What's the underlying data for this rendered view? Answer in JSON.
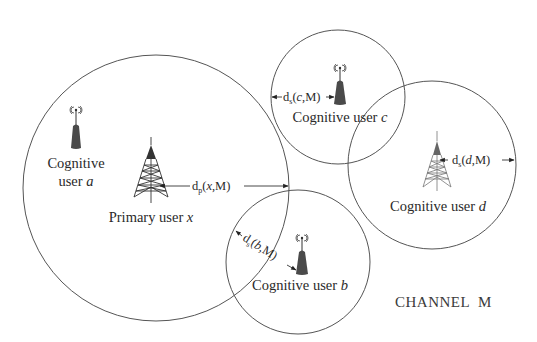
{
  "diagram": {
    "channel_label": "CHANNEL  M",
    "nodes": {
      "primary_x": {
        "label_prefix": "Primary user ",
        "label_var": "x",
        "icon": "transmission-tower-icon",
        "type": "primary"
      },
      "cognitive_a": {
        "label_line1": "Cognitive",
        "label_line2_prefix": "user ",
        "label_var": "a",
        "icon": "wireless-device-icon",
        "type": "cognitive"
      },
      "cognitive_b": {
        "label_prefix": "Cognitive user ",
        "label_var": "b",
        "icon": "wireless-device-icon",
        "type": "cognitive"
      },
      "cognitive_c": {
        "label_prefix": "Cognitive user ",
        "label_var": "c",
        "icon": "wireless-device-icon",
        "type": "cognitive"
      },
      "cognitive_d": {
        "label_prefix": "Cognitive user ",
        "label_var": "d",
        "icon": "transmission-tower-icon",
        "type": "cognitive"
      }
    },
    "distances": {
      "dp_x": {
        "base": "d",
        "sub": "p",
        "open": "(",
        "var": "x",
        "rest": ",M)"
      },
      "ds_b": {
        "base": "d",
        "sub": "s",
        "open": "(",
        "var": "b",
        "rest": ",M)"
      },
      "ds_c": {
        "base": "d",
        "sub": "s",
        "open": "(",
        "var": "c",
        "rest": ",M)"
      },
      "ds_d": {
        "base": "d",
        "sub": "s",
        "open": "(",
        "var": "d",
        "rest": ",M)"
      }
    },
    "edges": [
      {
        "from": "primary_x",
        "to": "coverage-boundary-x",
        "label": "dp_x"
      },
      {
        "from": "cognitive_b",
        "to": "coverage-boundary-b",
        "label": "ds_b"
      },
      {
        "from": "cognitive_c",
        "to": "coverage-boundary-c",
        "label": "ds_c"
      },
      {
        "from": "cognitive_d",
        "to": "coverage-boundary-d",
        "label": "ds_d"
      }
    ]
  }
}
